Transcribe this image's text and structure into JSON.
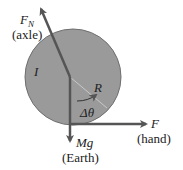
{
  "diagram": {
    "object": {
      "label": "I",
      "radius_label": "R",
      "angle_label": "Δθ",
      "fill": "#9a9a9a"
    },
    "forces": [
      {
        "symbol": "F",
        "subscript": "N",
        "source": "(axle)"
      },
      {
        "symbol": "F",
        "subscript": "",
        "source": "(hand)"
      },
      {
        "symbol": "Mg",
        "subscript": "",
        "source": "(Earth)"
      }
    ],
    "colors": {
      "arrow": "#5a5a5a",
      "disk": "#9a9a9a",
      "disk_edge": "#6e6e6e",
      "text": "#222222"
    }
  }
}
